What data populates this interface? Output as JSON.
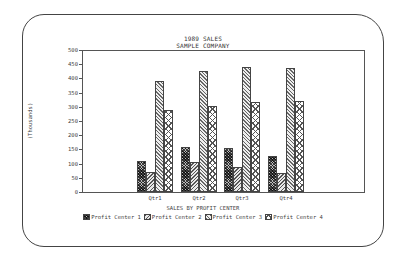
{
  "chart_data": {
    "type": "bar",
    "title": "1989 SALES",
    "subtitle": "SAMPLE COMPANY",
    "xlabel": "SALES BY PROFIT CENTER",
    "ylabel": "(Thousands)",
    "ylim": [
      0,
      500
    ],
    "yticks": [
      0,
      50,
      100,
      150,
      200,
      250,
      300,
      350,
      400,
      450,
      500
    ],
    "grid": false,
    "legend_position": "bottom",
    "categories": [
      "Qtr1",
      "Qtr2",
      "Qtr3",
      "Qtr4"
    ],
    "series": [
      {
        "name": "Profit Center 1",
        "values": [
          110,
          158,
          155,
          127
        ]
      },
      {
        "name": "Profit Center 2",
        "values": [
          70,
          106,
          88,
          67
        ]
      },
      {
        "name": "Profit Center 3",
        "values": [
          391,
          426,
          440,
          437
        ]
      },
      {
        "name": "Profit Center 4",
        "values": [
          289,
          303,
          317,
          320
        ]
      }
    ]
  }
}
